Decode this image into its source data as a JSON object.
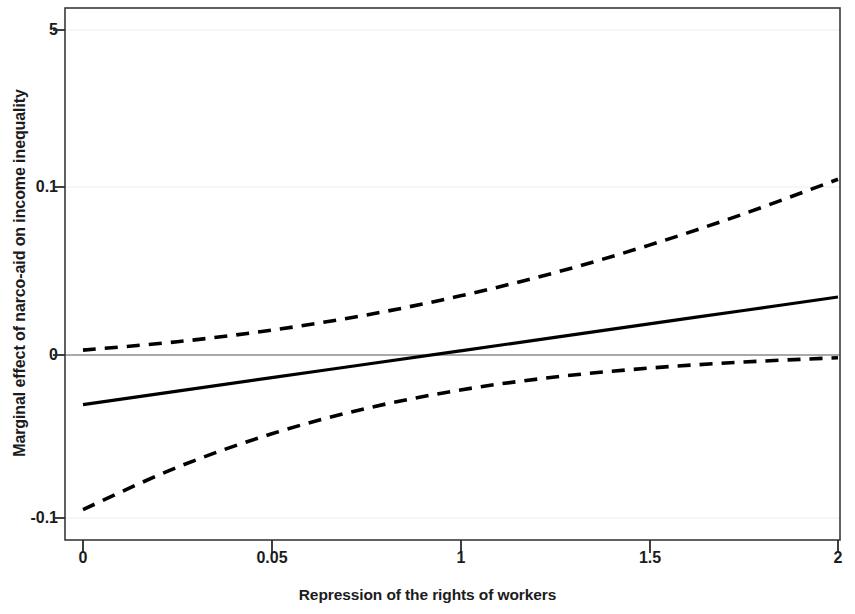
{
  "chart_data": {
    "type": "line",
    "title": "",
    "xlabel": "Repression of the rights of workers",
    "ylabel": "Marginal effect of narco-aid on income inequality",
    "x_tick_labels": [
      "0",
      "0.05",
      "1",
      "1.5",
      "2"
    ],
    "x_tick_values": [
      0,
      0.5,
      1,
      1.5,
      2
    ],
    "y_tick_labels": [
      "5",
      "0.1",
      "0",
      "-0.1"
    ],
    "y_tick_values": [
      0.5,
      0.1,
      0,
      -0.1
    ],
    "xlim": [
      0,
      2
    ],
    "ylim": [
      -0.1,
      0.5
    ],
    "grid": true,
    "legend_position": "none",
    "zero_reference_line": 0,
    "series": [
      {
        "name": "Marginal effect",
        "style": "solid",
        "color": "#000000",
        "x": [
          0,
          0.25,
          0.5,
          0.75,
          1,
          1.25,
          1.5,
          1.75,
          2
        ],
        "values": [
          -0.0295,
          -0.0215,
          -0.0135,
          -0.0055,
          0.0025,
          0.0105,
          0.0185,
          0.0265,
          0.0345
        ]
      },
      {
        "name": "Upper 95% confidence bound",
        "style": "dashed",
        "color": "#000000",
        "x": [
          0,
          0.25,
          0.5,
          0.75,
          1,
          1.25,
          1.5,
          1.75,
          2
        ],
        "values": [
          0.0029,
          0.0079,
          0.0148,
          0.0238,
          0.0352,
          0.049,
          0.0654,
          0.084,
          0.1046
        ]
      },
      {
        "name": "Lower 95% confidence bound",
        "style": "dashed",
        "color": "#000000",
        "x": [
          0,
          0.25,
          0.5,
          0.75,
          1,
          1.25,
          1.5,
          1.75,
          2
        ],
        "values": [
          -0.092,
          -0.0668,
          -0.0469,
          -0.0318,
          -0.0208,
          -0.0131,
          -0.0078,
          -0.0042,
          -0.0016
        ]
      }
    ],
    "annotations": []
  }
}
